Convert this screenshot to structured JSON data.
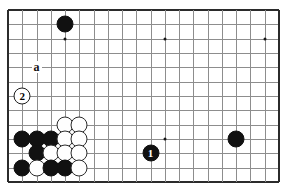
{
  "figure": {
    "kind": "go-board-diagram",
    "board_size": 19,
    "view": "lower-left corner crop",
    "columns": 20,
    "rows": 13,
    "colors": {
      "black_stone": "#111111",
      "white_stone": "#fefefe",
      "stone_outline": "#2a2a2a",
      "grid_line": "#8d8d8d",
      "border_line": "#2b2b2b",
      "background": "#ffffff"
    }
  },
  "geometry": {
    "origin_x": 8,
    "origin_y": 10,
    "step_x": 14.26,
    "step_y": 14.33,
    "stone_diameter": 17
  },
  "star_points": [
    {
      "col": 4,
      "row": 2
    },
    {
      "col": 11,
      "row": 2
    },
    {
      "col": 18,
      "row": 2
    },
    {
      "col": 11,
      "row": 9
    }
  ],
  "stones": [
    {
      "id": "b-top-left",
      "color": "black",
      "col": 4,
      "row": 1,
      "label": ""
    },
    {
      "id": "w-c4r8",
      "color": "white",
      "col": 4,
      "row": 8,
      "label": ""
    },
    {
      "id": "w-c5r8",
      "color": "white",
      "col": 5,
      "row": 8,
      "label": ""
    },
    {
      "id": "b-c1r9",
      "color": "black",
      "col": 1,
      "row": 9,
      "label": ""
    },
    {
      "id": "b-c2r9",
      "color": "black",
      "col": 2,
      "row": 9,
      "label": ""
    },
    {
      "id": "b-c3r9",
      "color": "black",
      "col": 3,
      "row": 9,
      "label": ""
    },
    {
      "id": "w-c4r9",
      "color": "white",
      "col": 4,
      "row": 9,
      "label": ""
    },
    {
      "id": "w-c5r9",
      "color": "white",
      "col": 5,
      "row": 9,
      "label": ""
    },
    {
      "id": "b-c2r10",
      "color": "black",
      "col": 2,
      "row": 10,
      "label": ""
    },
    {
      "id": "w-c3r10",
      "color": "white",
      "col": 3,
      "row": 10,
      "label": ""
    },
    {
      "id": "w-c4r10",
      "color": "white",
      "col": 4,
      "row": 10,
      "label": ""
    },
    {
      "id": "w-c5r10",
      "color": "white",
      "col": 5,
      "row": 10,
      "label": ""
    },
    {
      "id": "b-c1r11",
      "color": "black",
      "col": 1,
      "row": 11,
      "label": ""
    },
    {
      "id": "w-c2r11",
      "color": "white",
      "col": 2,
      "row": 11,
      "label": ""
    },
    {
      "id": "b-c3r11",
      "color": "black",
      "col": 3,
      "row": 11,
      "label": ""
    },
    {
      "id": "b-c4r11",
      "color": "black",
      "col": 4,
      "row": 11,
      "label": ""
    },
    {
      "id": "w-c5r11",
      "color": "white",
      "col": 5,
      "row": 11,
      "label": ""
    },
    {
      "id": "b-right",
      "color": "black",
      "col": 16,
      "row": 9,
      "label": ""
    }
  ],
  "move_stones": [
    {
      "id": "move-1",
      "color": "black",
      "col": 10,
      "row": 10,
      "label": "1"
    },
    {
      "id": "move-2",
      "color": "white",
      "col": 1,
      "row": 6,
      "label": "2"
    }
  ],
  "point_labels": [
    {
      "id": "label-a",
      "text": "a",
      "col": 2,
      "row": 4
    }
  ]
}
